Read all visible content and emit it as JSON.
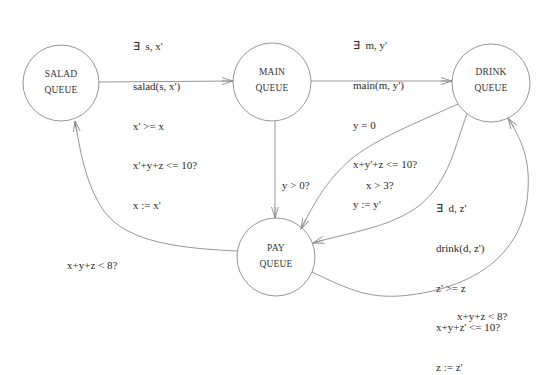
{
  "diagram": {
    "type": "state-machine",
    "nodes": [
      {
        "id": "salad",
        "line1": "SALAD",
        "line2": "QUEUE",
        "cx": 61,
        "cy": 83,
        "r": 38
      },
      {
        "id": "main",
        "line1": "MAIN",
        "line2": "QUEUE",
        "cx": 272,
        "cy": 82,
        "r": 39
      },
      {
        "id": "drink",
        "line1": "DRINK",
        "line2": "QUEUE",
        "cx": 491,
        "cy": 83,
        "r": 39
      },
      {
        "id": "pay",
        "line1": "PAY",
        "line2": "QUEUE",
        "cx": 276,
        "cy": 257,
        "r": 39
      }
    ],
    "edges": {
      "salad_to_main": {
        "from": "salad",
        "to": "main",
        "lines": [
          "∃  s, x'",
          "salad(s, x')",
          "x' >= x",
          "x'+y+z <= 10?",
          "x := x'"
        ]
      },
      "main_to_drink": {
        "from": "main",
        "to": "drink",
        "lines": [
          "∃  m, y'",
          "main(m, y')",
          "y = 0",
          "x+y'+z <= 10?",
          "y := y'"
        ]
      },
      "main_to_pay": {
        "from": "main",
        "to": "pay",
        "lines": [
          "y > 0?"
        ]
      },
      "drink_to_pay_x": {
        "from": "drink",
        "to": "pay",
        "lines": [
          "x > 3?"
        ]
      },
      "drink_to_pay_z": {
        "from": "drink",
        "to": "pay",
        "lines": [
          "∃  d, z'",
          "drink(d, z')",
          "z' >= z",
          "x+y+z' <= 10?",
          "z := z'"
        ]
      },
      "pay_to_salad": {
        "from": "pay",
        "to": "salad",
        "lines": [
          "x+y+z < 8?"
        ]
      },
      "pay_to_drink": {
        "from": "pay",
        "to": "drink",
        "lines": [
          "x+y+z < 8?"
        ]
      }
    },
    "colors": {
      "stroke": "#8a8a8a",
      "text": "#2a2a2a",
      "background": "#ffffff"
    }
  }
}
